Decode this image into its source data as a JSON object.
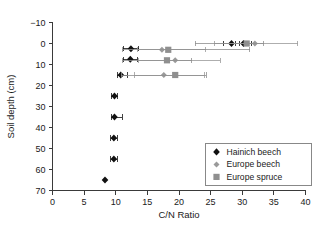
{
  "chart_data": {
    "type": "scatter",
    "title": "",
    "xlabel": "C/N Ratio",
    "ylabel": "Soil depth (cm)",
    "xlim": [
      0,
      40
    ],
    "ylim": [
      -10,
      70
    ],
    "y_inverted": true,
    "xticks": [
      0,
      5,
      10,
      15,
      20,
      25,
      30,
      35,
      40
    ],
    "yticks": [
      -10,
      0,
      10,
      20,
      30,
      40,
      50,
      60,
      70
    ],
    "xticklabels": [
      "0",
      "5",
      "10",
      "15",
      "20",
      "25",
      "30",
      "35",
      "40"
    ],
    "yticklabels": [
      "−10",
      "0",
      "10",
      "20",
      "30",
      "40",
      "50",
      "60",
      "70"
    ],
    "grid": false,
    "legend_position": "lower right",
    "series": [
      {
        "name": "Hainich beech",
        "marker": "diamond",
        "color": "#111111",
        "points": [
          {
            "x": 30.2,
            "depth": 0.0,
            "xerr_low": 29.0,
            "xerr_high": 31.4
          },
          {
            "x": 28.3,
            "depth": 0.0,
            "xerr_low": 27.1,
            "xerr_high": 29.5
          },
          {
            "x": 12.4,
            "depth": 2.5,
            "xerr_low": 11.2,
            "xerr_high": 13.6
          },
          {
            "x": 12.3,
            "depth": 7.5,
            "xerr_low": 11.2,
            "xerr_high": 13.4
          },
          {
            "x": 10.8,
            "depth": 15.0,
            "xerr_low": 10.2,
            "xerr_high": 11.8
          },
          {
            "x": 9.8,
            "depth": 25.0,
            "xerr_low": 9.3,
            "xerr_high": 10.3
          },
          {
            "x": 9.8,
            "depth": 35.0,
            "xerr_low": 9.3,
            "xerr_high": 11.0
          },
          {
            "x": 9.7,
            "depth": 45.0,
            "xerr_low": 9.2,
            "xerr_high": 10.2
          },
          {
            "x": 9.7,
            "depth": 55.0,
            "xerr_low": 9.2,
            "xerr_high": 10.2
          },
          {
            "x": 8.3,
            "depth": 65.0,
            "xerr_low": 8.3,
            "xerr_high": 8.3
          }
        ]
      },
      {
        "name": "Europe beech",
        "marker": "diamond-small",
        "color": "#9a9a9a",
        "points": [
          {
            "x": 32.0,
            "depth": 0.0,
            "xerr_low": 25.6,
            "xerr_high": 38.8
          },
          {
            "x": 17.3,
            "depth": 3.0,
            "xerr_low": 13.4,
            "xerr_high": 24.2
          },
          {
            "x": 19.4,
            "depth": 8.0,
            "xerr_low": 13.6,
            "xerr_high": 26.5
          },
          {
            "x": 17.6,
            "depth": 15.0,
            "xerr_low": 13.0,
            "xerr_high": 24.0
          }
        ]
      },
      {
        "name": "Europe spruce",
        "marker": "square",
        "color": "#8f8f8f",
        "points": [
          {
            "x": 30.7,
            "depth": 0.0,
            "xerr_low": 22.6,
            "xerr_high": 33.4
          },
          {
            "x": 18.3,
            "depth": 3.0,
            "xerr_low": 11.0,
            "xerr_high": 31.2
          },
          {
            "x": 18.1,
            "depth": 8.0,
            "xerr_low": 11.0,
            "xerr_high": 22.0
          },
          {
            "x": 19.4,
            "depth": 15.0,
            "xerr_low": 10.9,
            "xerr_high": 24.3
          }
        ]
      }
    ]
  },
  "legend": {
    "entries": [
      {
        "label": "Hainich beech",
        "color": "#111111",
        "marker": "diamond"
      },
      {
        "label": "Europe beech",
        "color": "#9a9a9a",
        "marker": "diamond-small"
      },
      {
        "label": "Europe spruce",
        "color": "#8f8f8f",
        "marker": "square"
      }
    ]
  }
}
